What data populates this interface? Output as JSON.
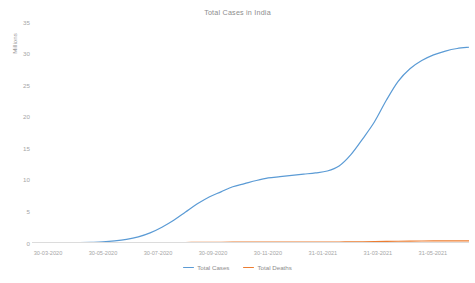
{
  "chart_data": {
    "type": "line",
    "title": "Total Cases in India",
    "xlabel": "",
    "ylabel": "Millions",
    "ylim": [
      0,
      35
    ],
    "yticks": [
      0,
      5,
      10,
      15,
      20,
      25,
      30,
      35
    ],
    "ytick_labels": [
      "0",
      "5",
      "10",
      "15",
      "20",
      "25",
      "30",
      "35"
    ],
    "grid": false,
    "legend_position": "bottom",
    "x": [
      "30-03-2020",
      "30-04-2020",
      "30-05-2020",
      "30-06-2020",
      "30-07-2020",
      "30-08-2020",
      "30-09-2020",
      "30-10-2020",
      "30-11-2020",
      "31-12-2020",
      "31-01-2021",
      "28-02-2021",
      "31-03-2021",
      "30-04-2021",
      "31-05-2021"
    ],
    "xtick_labels": [
      "30-03-2020",
      "30-05-2020",
      "30-07-2020",
      "30-09-2020",
      "30-11-2020",
      "31-01-2021",
      "31-03-2021",
      "31-05-2021"
    ],
    "series": [
      {
        "name": "Total Cases",
        "color": "#5B9BD5",
        "values": [
          0.0,
          0.03,
          0.18,
          0.57,
          1.6,
          3.6,
          6.2,
          8.1,
          9.4,
          10.3,
          10.7,
          11.1,
          12.2,
          19.2,
          28.2
        ],
        "values_fine": [
          0.0,
          0.005,
          0.01,
          0.03,
          0.06,
          0.11,
          0.18,
          0.33,
          0.57,
          0.97,
          1.6,
          2.5,
          3.6,
          4.9,
          6.2,
          7.3,
          8.1,
          8.9,
          9.4,
          9.9,
          10.3,
          10.5,
          10.7,
          10.9,
          11.1,
          11.4,
          12.2,
          14.0,
          16.5,
          19.2,
          22.6,
          25.6,
          27.6,
          28.9,
          29.8,
          30.4,
          30.8,
          31.0
        ]
      },
      {
        "name": "Total Deaths",
        "color": "#ED7D31",
        "values": [
          0.0,
          0.001,
          0.005,
          0.017,
          0.035,
          0.064,
          0.097,
          0.121,
          0.137,
          0.149,
          0.154,
          0.157,
          0.162,
          0.211,
          0.329
        ],
        "values_fine": [
          0.0,
          0.0,
          0.001,
          0.002,
          0.003,
          0.004,
          0.005,
          0.01,
          0.017,
          0.025,
          0.035,
          0.049,
          0.064,
          0.081,
          0.097,
          0.11,
          0.121,
          0.13,
          0.137,
          0.143,
          0.149,
          0.152,
          0.154,
          0.156,
          0.157,
          0.159,
          0.162,
          0.171,
          0.186,
          0.211,
          0.246,
          0.281,
          0.303,
          0.316,
          0.324,
          0.329,
          0.332,
          0.334
        ]
      }
    ]
  },
  "legend": {
    "items": [
      {
        "label": "Total Cases",
        "color": "#5B9BD5"
      },
      {
        "label": "Total Deaths",
        "color": "#ED7D31"
      }
    ]
  },
  "axis": {
    "line_color": "#dcdcdc",
    "tick_color": "#a6a6a6"
  }
}
